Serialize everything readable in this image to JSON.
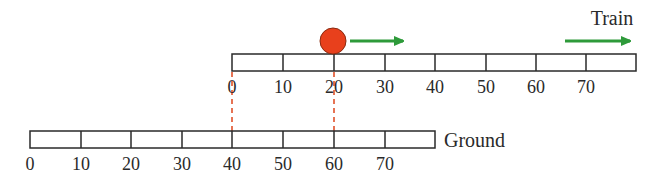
{
  "diagram": {
    "type": "reference-frames",
    "train": {
      "label": "Train",
      "ticks": [
        "0",
        "10",
        "20",
        "30",
        "40",
        "50",
        "60",
        "70"
      ],
      "velocity_arrow_color": "#2e9a3a"
    },
    "ground": {
      "label": "Ground",
      "ticks": [
        "0",
        "10",
        "20",
        "30",
        "40",
        "50",
        "60",
        "70"
      ]
    },
    "ball": {
      "color": "#e8401c",
      "position_train": "20",
      "position_ground": "60",
      "velocity_arrow_color": "#2e9a3a"
    },
    "correspondences": [
      {
        "train": "0",
        "ground": "40"
      },
      {
        "train": "20",
        "ground": "60"
      }
    ],
    "dashed_line_color": "#e0502a",
    "ruler_stroke": "#2a2a2a"
  }
}
